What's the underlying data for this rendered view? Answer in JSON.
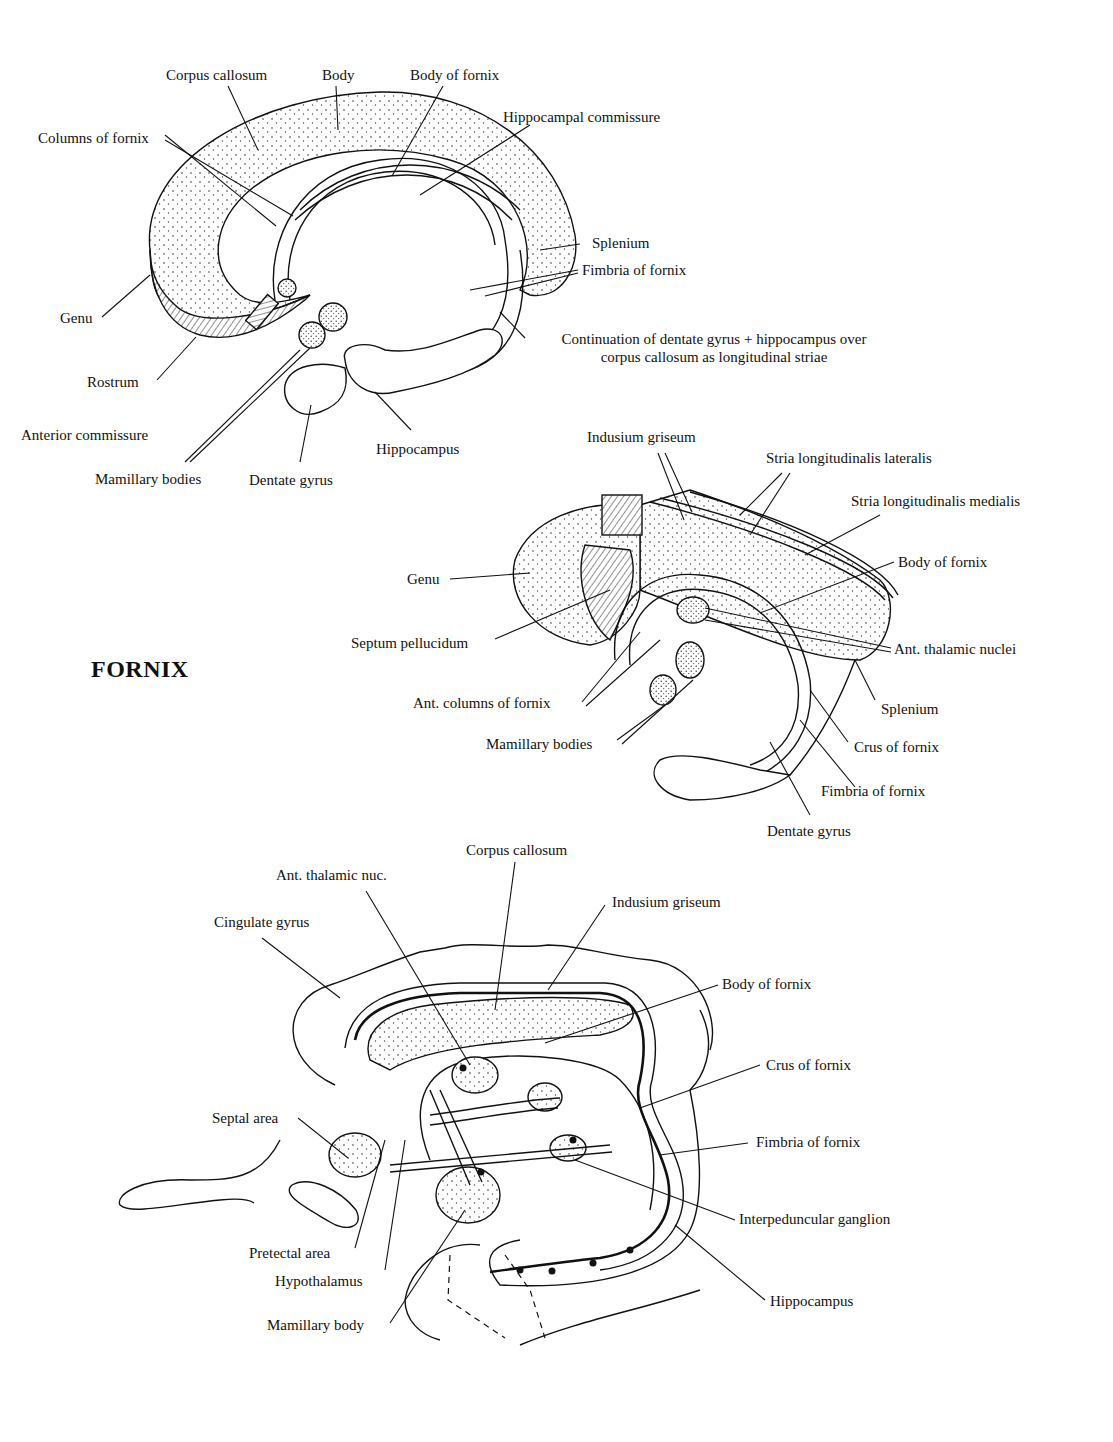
{
  "title": "FORNIX",
  "figures": [
    {
      "id": "medial-view",
      "labels": {
        "corpus_callosum": "Corpus callosum",
        "body": "Body",
        "body_of_fornix": "Body of fornix",
        "hippocampal_commissure": "Hippocampal commissure",
        "columns_of_fornix": "Columns of fornix",
        "splenium": "Splenium",
        "fimbria_of_fornix": "Fimbria of fornix",
        "genu": "Genu",
        "continuation_line1": "Continuation of dentate gyrus + hippocampus over",
        "continuation_line2": "corpus callosum as longitudinal striae",
        "rostrum": "Rostrum",
        "anterior_commissure": "Anterior commissure",
        "hippocampus": "Hippocampus",
        "mamillary_bodies": "Mamillary bodies",
        "dentate_gyrus": "Dentate gyrus"
      }
    },
    {
      "id": "perspective-view",
      "labels": {
        "indusium_griseum": "Indusium griseum",
        "stria_lateralis": "Stria longitudinalis lateralis",
        "stria_medialis": "Stria longitudinalis medialis",
        "body_of_fornix": "Body of fornix",
        "genu": "Genu",
        "septum_pellucidum": "Septum pellucidum",
        "ant_thalamic_nuclei": "Ant. thalamic nuclei",
        "ant_columns_of_fornix": "Ant. columns of fornix",
        "splenium": "Splenium",
        "mamillary_bodies": "Mamillary bodies",
        "crus_of_fornix": "Crus of fornix",
        "fimbria_of_fornix": "Fimbria of fornix",
        "dentate_gyrus": "Dentate gyrus"
      }
    },
    {
      "id": "connections-schematic",
      "labels": {
        "corpus_callosum": "Corpus callosum",
        "ant_thalamic_nuc": "Ant. thalamic nuc.",
        "indusium_griseum": "Indusium griseum",
        "cingulate_gyrus": "Cingulate gyrus",
        "body_of_fornix": "Body of fornix",
        "crus_of_fornix": "Crus of fornix",
        "septal_area": "Septal area",
        "fimbria_of_fornix": "Fimbria of fornix",
        "interpeduncular_ganglion": "Interpeduncular ganglion",
        "pretectal_area": "Pretectal area",
        "hypothalamus": "Hypothalamus",
        "hippocampus": "Hippocampus",
        "mamillary_body": "Mamillary body"
      }
    }
  ]
}
